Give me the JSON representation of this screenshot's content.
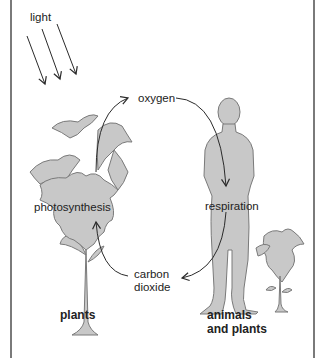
{
  "diagram": {
    "title": "",
    "labels": {
      "light": "light",
      "oxygen": "oxygen",
      "photosynthesis": "photosynthesis",
      "respiration": "respiration",
      "carbon_dioxide_line1": "carbon",
      "carbon_dioxide_line2": "dioxide",
      "plants": "plants",
      "animals_line1": "animals",
      "animals_line2": "and plants"
    },
    "nodes": [
      {
        "id": "plant",
        "label": "photosynthesis",
        "caption": "plants"
      },
      {
        "id": "human",
        "label": "respiration",
        "caption": "animals and plants"
      }
    ],
    "edges": [
      {
        "from": "plant",
        "to": "human",
        "label": "oxygen"
      },
      {
        "from": "human",
        "to": "plant",
        "label": "carbon dioxide"
      },
      {
        "from": "light",
        "to": "plant",
        "label": "light",
        "count": 3
      }
    ],
    "colors": {
      "fill": "#c8c8c8",
      "outline": "#7a7a7a",
      "arrow": "#2a2a2a",
      "frame": "#7a7a7a"
    }
  }
}
